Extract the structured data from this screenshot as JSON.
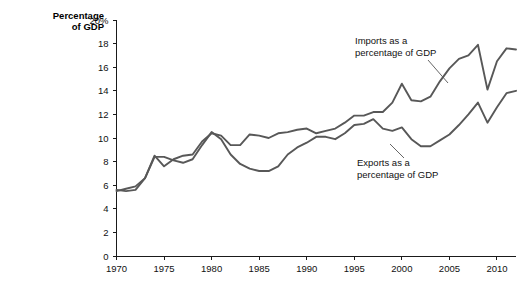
{
  "chart_data": {
    "type": "line",
    "title": "",
    "ylabel": "Percentage of GDP",
    "xlabel": "",
    "ylim": [
      0,
      20
    ],
    "xlim": [
      1970,
      2012
    ],
    "grid": false,
    "legend_position": "inline-annotations",
    "y_ticks": [
      "0",
      "2",
      "4",
      "6",
      "8",
      "10",
      "12",
      "14",
      "16",
      "18",
      "20%"
    ],
    "y_tick_values": [
      0,
      2,
      4,
      6,
      8,
      10,
      12,
      14,
      16,
      18,
      20
    ],
    "x_ticks": [
      "1970",
      "1975",
      "1980",
      "1985",
      "1990",
      "1995",
      "2000",
      "2005",
      "2010"
    ],
    "x_tick_values": [
      1970,
      1975,
      1980,
      1985,
      1990,
      1995,
      2000,
      2005,
      2010
    ],
    "x": [
      1970,
      1971,
      1972,
      1973,
      1974,
      1975,
      1976,
      1977,
      1978,
      1979,
      1980,
      1981,
      1982,
      1983,
      1984,
      1985,
      1986,
      1987,
      1988,
      1989,
      1990,
      1991,
      1992,
      1993,
      1994,
      1995,
      1996,
      1997,
      1998,
      1999,
      2000,
      2001,
      2002,
      2003,
      2004,
      2005,
      2006,
      2007,
      2008,
      2009,
      2010,
      2011,
      2012
    ],
    "series": [
      {
        "name": "Imports as a percentage of GDP",
        "color": "#585858",
        "values": [
          5.5,
          5.7,
          5.9,
          6.6,
          8.5,
          7.6,
          8.2,
          8.5,
          8.6,
          9.7,
          10.4,
          10.2,
          9.4,
          9.4,
          10.3,
          10.2,
          10.0,
          10.4,
          10.5,
          10.7,
          10.8,
          10.4,
          10.6,
          10.8,
          11.3,
          11.9,
          11.9,
          12.2,
          12.2,
          13.0,
          14.6,
          13.2,
          13.1,
          13.5,
          14.8,
          15.9,
          16.7,
          17.0,
          17.9,
          14.1,
          16.5,
          17.6,
          17.5
        ]
      },
      {
        "name": "Exports as a percentage of GDP",
        "color": "#585858",
        "values": [
          5.6,
          5.5,
          5.6,
          6.6,
          8.4,
          8.4,
          8.1,
          7.9,
          8.2,
          9.4,
          10.5,
          9.9,
          8.6,
          7.8,
          7.4,
          7.2,
          7.2,
          7.6,
          8.6,
          9.2,
          9.6,
          10.1,
          10.1,
          9.9,
          10.4,
          11.1,
          11.2,
          11.6,
          10.8,
          10.6,
          10.9,
          9.9,
          9.3,
          9.3,
          9.8,
          10.3,
          11.1,
          12.0,
          13.0,
          11.3,
          12.6,
          13.8,
          14.0
        ]
      }
    ],
    "annotations": [
      {
        "id": "imports-annotation",
        "line1": "Imports as a",
        "line2": "percentage of GDP"
      },
      {
        "id": "exports-annotation",
        "line1": "Exports as a",
        "line2": "percentage of GDP"
      }
    ]
  }
}
